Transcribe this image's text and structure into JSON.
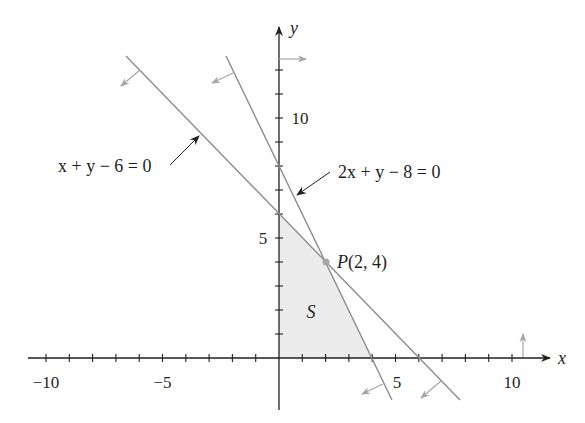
{
  "figure": {
    "axes": {
      "x_label": "x",
      "y_label": "y",
      "x_ticks": [
        {
          "value": -10,
          "label": "−10"
        },
        {
          "value": -5,
          "label": "−5"
        },
        {
          "value": 5,
          "label": "5"
        },
        {
          "value": 10,
          "label": "10"
        }
      ],
      "y_ticks": [
        {
          "value": 5,
          "label": "5"
        },
        {
          "value": 10,
          "label": "10"
        }
      ],
      "x_range": [
        -11,
        12
      ],
      "y_range": [
        -2,
        14
      ],
      "tick_interval": 1
    },
    "lines": [
      {
        "id": "line1",
        "equation": "x + y − 6 = 0",
        "color": "#8c8c8c"
      },
      {
        "id": "line2",
        "equation": "2x + y − 8 = 0",
        "color": "#8c8c8c"
      }
    ],
    "point": {
      "name": "P",
      "label_rest": "(2, 4)",
      "x": 2,
      "y": 4
    },
    "region": {
      "label": "S",
      "fill": "#ececec",
      "vertices": [
        [
          0,
          0
        ],
        [
          4,
          0
        ],
        [
          2,
          4
        ],
        [
          0,
          6
        ]
      ]
    },
    "colors": {
      "axis": "#231f20",
      "constraint_line": "#8c8c8c",
      "half_plane_arrow": "#a6a6a6",
      "region_fill": "#ececec",
      "point": "#a6a6a6"
    }
  }
}
